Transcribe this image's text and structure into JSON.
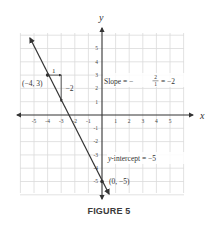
{
  "figure": {
    "caption": "FIGURE 5",
    "axes": {
      "x_label": "x",
      "y_label": "y",
      "x_ticks": [
        "-5",
        "-4",
        "-3",
        "-2",
        "-1",
        "1",
        "2",
        "3",
        "4",
        "5"
      ],
      "y_ticks": [
        "5",
        "4",
        "3",
        "2",
        "1",
        "-1",
        "-2",
        "-3",
        "-4",
        "-5"
      ],
      "range": [
        -6,
        6
      ],
      "grid": true
    },
    "line": {
      "equation": "y = -2x - 5",
      "slope": -2,
      "intercept": -5,
      "color": "#333333"
    },
    "points": [
      {
        "label": "(−4, 3)",
        "x": -4,
        "y": 3
      },
      {
        "label": "(0, −5)",
        "x": 0,
        "y": -5
      }
    ],
    "annotations": {
      "run": "1",
      "rise": "−2",
      "slope_prefix": "Slope = −",
      "slope_num": "2",
      "slope_den": "1",
      "slope_suffix": "= −2",
      "intercept_italic": "y",
      "intercept_text": "-intercept = −5"
    },
    "colors": {
      "grid": "#d9d9d9",
      "axis": "#333333",
      "text": "#333333"
    }
  }
}
